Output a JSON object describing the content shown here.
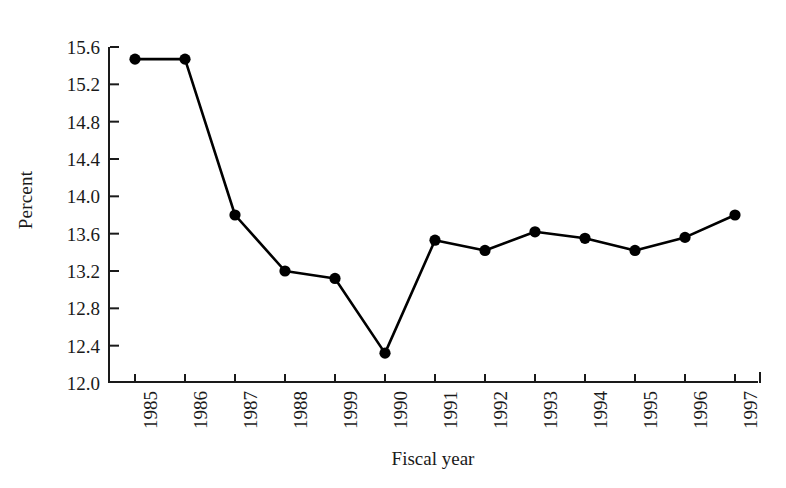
{
  "chart_data": {
    "type": "line",
    "title": "",
    "xlabel": "Fiscal year",
    "ylabel": "Percent",
    "categories": [
      "1985",
      "1986",
      "1987",
      "1988",
      "1999",
      "1990",
      "1991",
      "1992",
      "1993",
      "1994",
      "1995",
      "1996",
      "1997"
    ],
    "values": [
      15.47,
      15.47,
      13.8,
      13.2,
      13.12,
      12.32,
      13.53,
      13.42,
      13.62,
      13.55,
      13.42,
      13.56,
      13.8
    ],
    "series": [
      {
        "name": "Percent",
        "values": [
          15.47,
          15.47,
          13.8,
          13.2,
          13.12,
          12.32,
          13.53,
          13.42,
          13.62,
          13.55,
          13.42,
          13.56,
          13.8
        ]
      }
    ],
    "ylim": [
      12.0,
      15.6
    ],
    "ytick_labels": [
      "12.0",
      "12.4",
      "12.8",
      "13.2",
      "13.6",
      "14.0",
      "14.4",
      "14.8",
      "15.2",
      "15.6"
    ],
    "ytick_values": [
      12.0,
      12.4,
      12.8,
      13.2,
      13.6,
      14.0,
      14.4,
      14.8,
      15.2,
      15.6
    ],
    "grid": false,
    "legend": "none",
    "marker": "filled-circle",
    "line_color": "#000000",
    "marker_color": "#000000",
    "background_color": "#ffffff"
  }
}
